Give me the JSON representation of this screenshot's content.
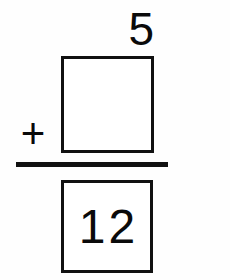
{
  "problem": {
    "type": "vertical-addition",
    "addend_known": "5",
    "operator": "+",
    "addend_missing_value": "",
    "sum": "12",
    "ink_color": "#111111",
    "paper_color": "#ffffff"
  },
  "chart_data": {
    "type": "table",
    "title": "",
    "rows": [
      {
        "label": "addend-1",
        "value": "5"
      },
      {
        "label": "operator",
        "value": "+"
      },
      {
        "label": "addend-2",
        "value": ""
      },
      {
        "label": "sum",
        "value": "12"
      }
    ]
  }
}
